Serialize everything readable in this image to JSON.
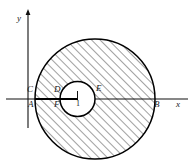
{
  "figure": {
    "kind": "annulus-hatched-geometry-diagram",
    "background_color": "#ffffff",
    "stroke_color": "#000000",
    "hatch_color": "#2b2b2b"
  },
  "axes": {
    "x_axis": {
      "label": "x",
      "label_x": 177,
      "label_y": 103,
      "y": 99,
      "x_start": 6,
      "x_end": 188
    },
    "y_axis": {
      "label": "y",
      "label_x": 18,
      "label_y": 17,
      "x": 28,
      "y_start": 10,
      "y_end": 128,
      "arrowhead": "up-arrow-icon"
    }
  },
  "shapes": {
    "outer_circle": {
      "name": "outer-circle",
      "cx": 95,
      "cy": 99,
      "r": 60,
      "fill": "hatched",
      "stroke_width": 1.4
    },
    "inner_circle": {
      "name": "inner-circle",
      "cx": 77.5,
      "cy": 99,
      "r": 17.5,
      "fill": "white",
      "stroke_width": 1.4
    },
    "chord_segment": {
      "name": "axis-chord-segment",
      "x1": 35,
      "x2": 77.5,
      "y": 99
    },
    "center_tick": {
      "name": "center-tick-mark",
      "x": 77.5,
      "y_top": 92,
      "y_bottom": 106
    }
  },
  "labels": [
    {
      "id": "point-C",
      "text": "C",
      "x": 28,
      "y": 89,
      "style": "italic"
    },
    {
      "id": "point-A",
      "text": "A",
      "x": 29,
      "y": 101,
      "style": "italic"
    },
    {
      "id": "point-D",
      "text": "D",
      "x": 55,
      "y": 89,
      "style": "italic"
    },
    {
      "id": "point-F",
      "text": "F",
      "x": 55,
      "y": 101,
      "style": "italic"
    },
    {
      "id": "value-1",
      "text": "1",
      "x": 77,
      "y": 101,
      "style": "upright"
    },
    {
      "id": "point-E",
      "text": "E",
      "x": 97,
      "y": 88,
      "style": "italic"
    },
    {
      "id": "point-B",
      "text": "B",
      "x": 155,
      "y": 101,
      "style": "italic"
    }
  ]
}
